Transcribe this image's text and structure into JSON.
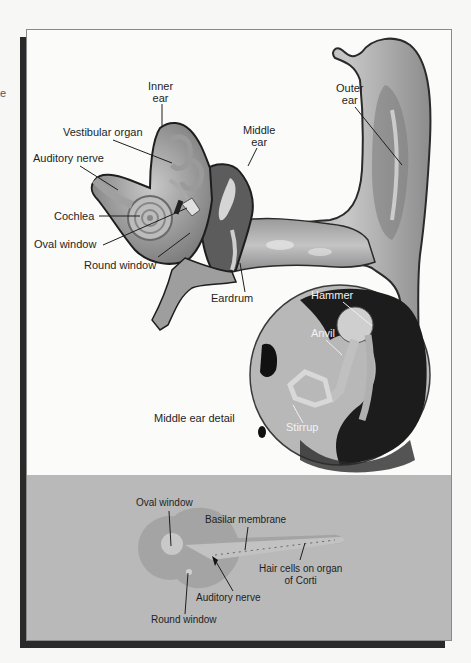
{
  "figure": {
    "edge_glyphs": [
      "e",
      "A"
    ],
    "colors": {
      "frame_border": "#8a8a8a",
      "shadow": "#2a2a2a",
      "band": "#b9b9b9",
      "paper": "#fbfbfa"
    }
  },
  "ear_diagram": {
    "labels": {
      "inner_ear": [
        "Inner",
        "ear"
      ],
      "vestibular_organ": "Vestibular organ",
      "auditory_nerve": "Auditory nerve",
      "cochlea": "Cochlea",
      "oval_window": "Oval window",
      "round_window": "Round window",
      "middle_ear": [
        "Middle",
        "ear"
      ],
      "outer_ear": [
        "Outer",
        "ear"
      ],
      "eardrum": "Eardrum"
    }
  },
  "middle_ear_detail": {
    "caption": "Middle ear detail",
    "labels": {
      "hammer": "Hammer",
      "anvil": "Anvil",
      "stirrup": "Stirrup"
    }
  },
  "cochlea_schematic": {
    "labels": {
      "oval_window": "Oval window",
      "basilar_membrane": "Basilar membrane",
      "hair_cells": [
        "Hair cells on organ",
        "of Corti"
      ],
      "auditory_nerve": "Auditory nerve",
      "round_window": "Round window"
    }
  }
}
